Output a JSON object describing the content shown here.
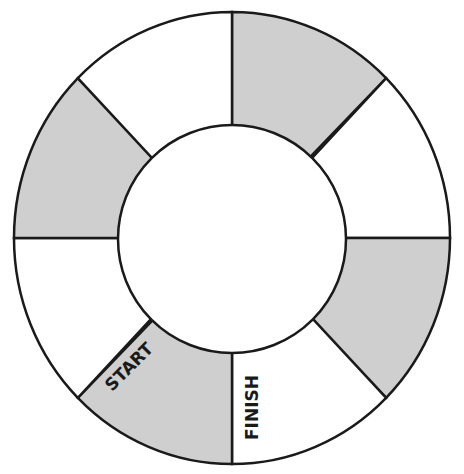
{
  "board": {
    "center": [
      232,
      238
    ],
    "outer_rx": 218,
    "outer_ry": 226,
    "inner_r": 114,
    "stroke_color": "#1a1a1a",
    "shaded_color": "#cfcfcf",
    "unshaded_color": "#ffffff",
    "sectors": [
      {
        "index": 0,
        "from_deg": -90,
        "to_deg": -45,
        "shaded": true
      },
      {
        "index": 1,
        "from_deg": -45,
        "to_deg": 0,
        "shaded": false
      },
      {
        "index": 2,
        "from_deg": 0,
        "to_deg": 45,
        "shaded": true
      },
      {
        "index": 3,
        "from_deg": 45,
        "to_deg": 90,
        "shaded": false,
        "label": "FINISH"
      },
      {
        "index": 4,
        "from_deg": 90,
        "to_deg": 135,
        "shaded": true,
        "label": "START"
      },
      {
        "index": 5,
        "from_deg": 135,
        "to_deg": 180,
        "shaded": false
      },
      {
        "index": 6,
        "from_deg": 180,
        "to_deg": 225,
        "shaded": true
      },
      {
        "index": 7,
        "from_deg": 225,
        "to_deg": 270,
        "shaded": false
      }
    ]
  },
  "labels": {
    "start": "START",
    "finish": "FINISH"
  }
}
